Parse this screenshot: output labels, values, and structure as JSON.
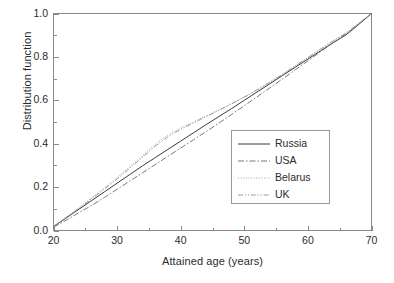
{
  "chart_data": {
    "type": "line",
    "title": "",
    "xlabel": "Attained age (years)",
    "ylabel": "Distribution function",
    "xlim": [
      20,
      70
    ],
    "ylim": [
      0.0,
      1.0
    ],
    "xticks": [
      20,
      30,
      40,
      50,
      60,
      70
    ],
    "xtick_labels": [
      "20",
      "30",
      "40",
      "50",
      "60",
      "70"
    ],
    "yticks": [
      0.0,
      0.2,
      0.4,
      0.6,
      0.8,
      1.0
    ],
    "ytick_labels": [
      "0.0",
      "0.2",
      "0.4",
      "0.6",
      "0.8",
      "1.0"
    ],
    "x_minor_ticks": [
      25,
      35,
      45,
      55,
      65
    ],
    "y_minor_ticks": [
      0.1,
      0.3,
      0.5,
      0.7,
      0.9
    ],
    "grid": false,
    "legend_position": "center-right",
    "x": [
      20,
      22,
      24,
      26,
      28,
      30,
      32,
      34,
      36,
      38,
      40,
      42,
      44,
      46,
      48,
      50,
      52,
      54,
      56,
      58,
      60,
      62,
      64,
      66,
      68,
      70
    ],
    "series": [
      {
        "name": "Russia",
        "style": "solid",
        "color": "#3a3a3a",
        "values": [
          0.018,
          0.058,
          0.098,
          0.138,
          0.178,
          0.218,
          0.258,
          0.298,
          0.336,
          0.374,
          0.412,
          0.45,
          0.488,
          0.525,
          0.562,
          0.6,
          0.638,
          0.676,
          0.714,
          0.752,
          0.79,
          0.828,
          0.866,
          0.902,
          0.95,
          1.0
        ]
      },
      {
        "name": "USA",
        "style": "dash-dot",
        "color": "#6a6a6a",
        "values": [
          0.015,
          0.048,
          0.082,
          0.116,
          0.152,
          0.19,
          0.228,
          0.266,
          0.304,
          0.342,
          0.38,
          0.418,
          0.456,
          0.495,
          0.535,
          0.575,
          0.616,
          0.657,
          0.698,
          0.74,
          0.782,
          0.824,
          0.866,
          0.906,
          0.952,
          1.0
        ]
      },
      {
        "name": "Belarus",
        "style": "dotted",
        "color": "#9a9a9a",
        "values": [
          0.02,
          0.062,
          0.105,
          0.15,
          0.196,
          0.244,
          0.294,
          0.345,
          0.396,
          0.44,
          0.472,
          0.5,
          0.528,
          0.556,
          0.585,
          0.615,
          0.648,
          0.683,
          0.72,
          0.758,
          0.797,
          0.836,
          0.874,
          0.91,
          0.955,
          1.0
        ]
      },
      {
        "name": "UK",
        "style": "dash-dot-dot",
        "color": "#8e8e8e",
        "values": [
          0.019,
          0.06,
          0.102,
          0.146,
          0.191,
          0.238,
          0.287,
          0.338,
          0.388,
          0.432,
          0.466,
          0.496,
          0.525,
          0.554,
          0.584,
          0.615,
          0.648,
          0.683,
          0.72,
          0.758,
          0.797,
          0.836,
          0.874,
          0.91,
          0.955,
          1.0
        ]
      }
    ]
  }
}
